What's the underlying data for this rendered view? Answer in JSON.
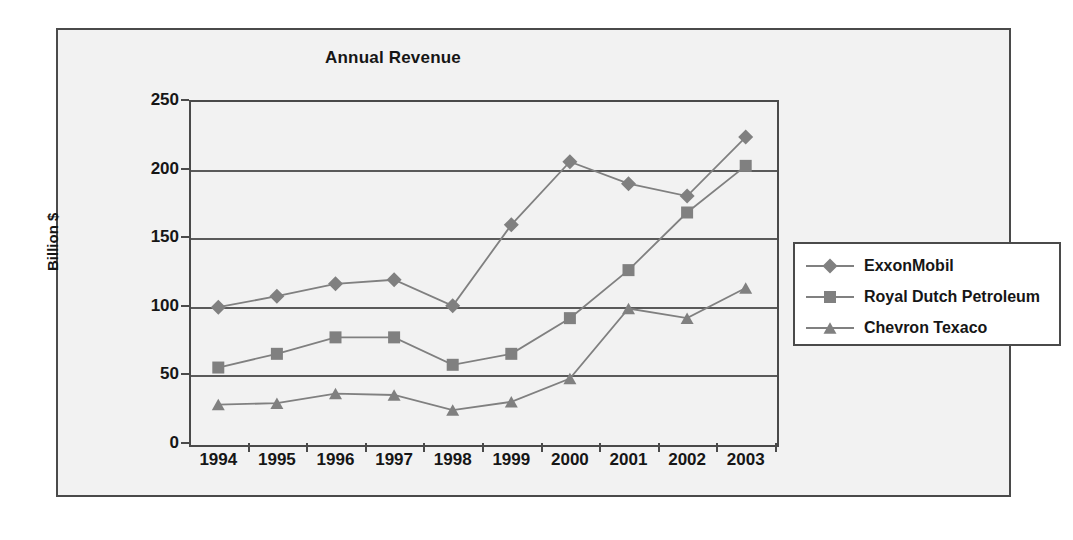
{
  "chart_data": {
    "type": "line",
    "title": "Annual Revenue",
    "xlabel": "",
    "ylabel": "Billion $",
    "categories": [
      "1994",
      "1995",
      "1996",
      "1997",
      "1998",
      "1999",
      "2000",
      "2001",
      "2002",
      "2003"
    ],
    "ylim": [
      0,
      250
    ],
    "yticks": [
      0,
      50,
      100,
      150,
      200,
      250
    ],
    "grid": true,
    "legend_position": "right",
    "series": [
      {
        "name": "ExxonMobil",
        "marker": "diamond",
        "color": "#808080",
        "values": [
          99,
          107,
          116,
          119,
          100,
          159,
          205,
          189,
          180,
          223
        ]
      },
      {
        "name": "Royal Dutch Petroleum",
        "marker": "square",
        "color": "#808080",
        "values": [
          55,
          65,
          77,
          77,
          57,
          65,
          91,
          126,
          168,
          202
        ]
      },
      {
        "name": "Chevron Texaco",
        "marker": "triangle",
        "color": "#808080",
        "values": [
          28,
          29,
          36,
          35,
          24,
          30,
          47,
          98,
          91,
          113
        ]
      }
    ]
  },
  "colors": {
    "frame_border": "#4a4a4a",
    "figure_background": "#f2f2f2",
    "axis": "#5a5a5a",
    "series_gray": "#808080",
    "text": "#161616"
  }
}
